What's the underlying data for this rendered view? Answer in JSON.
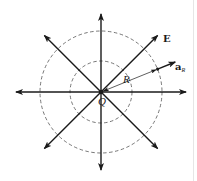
{
  "figure": {
    "colors": {
      "line": "#1a1a1a",
      "dashed_circle": "#555555",
      "background": "#ffffff"
    },
    "center": {
      "x": 101,
      "y": 92
    },
    "circles": [
      {
        "name": "inner",
        "radius": 31,
        "style": "dashed"
      },
      {
        "name": "outer",
        "radius": 61,
        "style": "dashed"
      }
    ],
    "field_lines": [
      {
        "name": "up",
        "angle_deg": 90,
        "length": 78
      },
      {
        "name": "down",
        "angle_deg": 270,
        "length": 78
      },
      {
        "name": "left",
        "angle_deg": 180,
        "length": 85
      },
      {
        "name": "right",
        "angle_deg": 0,
        "length": 85
      },
      {
        "name": "up-right",
        "angle_deg": 45,
        "length": 80
      },
      {
        "name": "up-left",
        "angle_deg": 135,
        "length": 80
      },
      {
        "name": "down-left",
        "angle_deg": 225,
        "length": 80
      },
      {
        "name": "down-right",
        "angle_deg": 315,
        "length": 80
      }
    ],
    "labels": {
      "field": "E",
      "charge": "Q",
      "distance": "R",
      "unit_vector_base": "a",
      "unit_vector_sub": "R"
    }
  }
}
